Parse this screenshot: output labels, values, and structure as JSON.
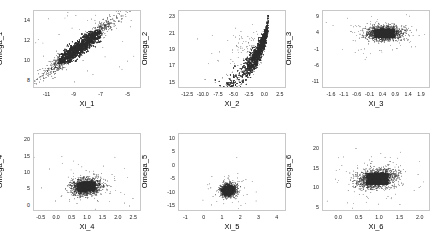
{
  "figure": {
    "background_color": "#ffffff",
    "frame_color": "#c8c8c8",
    "point_color": "#2b2b2b",
    "rows": 2,
    "cols": 3
  },
  "chart_data": [
    {
      "type": "scatter",
      "title": "",
      "xlabel": "Xi_1",
      "ylabel": "Omega_1",
      "xlim": [
        -12.0,
        -4.0
      ],
      "ylim": [
        7.2,
        15.0
      ],
      "xticks": [
        -11,
        -9,
        -7,
        -5
      ],
      "xticklabels": [
        "-11",
        "-9",
        "-7",
        "-5"
      ],
      "yticks": [
        8,
        10,
        12,
        14
      ],
      "yticklabels": [
        "8",
        "10",
        "12",
        "14"
      ],
      "grid": false,
      "legend": "none",
      "n_points": 1400,
      "relationship": "strong positive linear",
      "cluster": {
        "x_center": -8.6,
        "y_center": 11.4,
        "x_spread": 1.35,
        "y_spread": 1.45,
        "correlation": 0.96
      },
      "notes": "Dense elongated band rising from lower-left (-10.6, 9.3) to upper-right (-5.2, 14.2); sparse tail of lighter points at the upper right."
    },
    {
      "type": "scatter",
      "title": "",
      "xlabel": "Xi_2",
      "ylabel": "Omega_2",
      "xlim": [
        -14.0,
        3.5
      ],
      "ylim": [
        14.3,
        23.8
      ],
      "xticks": [
        -12.5,
        -10.0,
        -7.5,
        -5.0,
        -2.5,
        0.0,
        2.5
      ],
      "xticklabels": [
        "-12.5",
        "-10.0",
        "-7.5",
        "-5.0",
        "-2.5",
        "0.0",
        "2.5"
      ],
      "yticks": [
        15,
        17,
        19,
        21,
        23
      ],
      "yticklabels": [
        "15",
        "17",
        "19",
        "21",
        "23"
      ],
      "grid": false,
      "legend": "none",
      "n_points": 1400,
      "relationship": "nonlinear increasing, concave (exponential-like)",
      "cluster": {
        "x_center": 0.1,
        "y_center": 21.6,
        "x_spread": 0.75,
        "y_spread": 0.95,
        "correlation": 0.55
      },
      "notes": "Dense vertical cluster near x=0 spanning Omega 19.5-23.3, with a thinning curved tail sweeping down-left toward (-10, 17)."
    },
    {
      "type": "scatter",
      "title": "",
      "xlabel": "Xi_3",
      "ylabel": "Omega_3",
      "xlim": [
        -1.95,
        2.25
      ],
      "ylim": [
        -13.0,
        11.0
      ],
      "xticks": [
        -1.6,
        -1.1,
        -0.6,
        -0.1,
        0.4,
        0.9,
        1.4,
        1.9
      ],
      "xticklabels": [
        "-1.6",
        "-1.1",
        "-0.6",
        "-0.1",
        "0.4",
        "0.9",
        "1.4",
        "1.9"
      ],
      "yticks": [
        9,
        4,
        -1,
        -6,
        -11
      ],
      "yticklabels": [
        "9",
        "4",
        "-1",
        "-6",
        "-11"
      ],
      "grid": false,
      "legend": "none",
      "n_points": 1400,
      "relationship": "no correlation; horizontally elongated blob",
      "cluster": {
        "x_center": 0.45,
        "y_center": 4.1,
        "x_spread": 0.33,
        "y_spread": 1.1,
        "correlation": 0.05
      },
      "notes": "Flat dense horizontal cloud centered on Omega_3 = 4; a few scattered outliers above and well below the main band."
    },
    {
      "type": "scatter",
      "title": "",
      "xlabel": "Xi_4",
      "ylabel": "Omega_4",
      "xlim": [
        -0.75,
        2.75
      ],
      "ylim": [
        -1.8,
        22.0
      ],
      "xticks": [
        -0.5,
        0.0,
        0.5,
        1.0,
        1.5,
        2.0,
        2.5
      ],
      "xticklabels": [
        "-0.5",
        "0.0",
        "0.5",
        "1.0",
        "1.5",
        "2.0",
        "2.5"
      ],
      "yticks": [
        0,
        5,
        10,
        15,
        20
      ],
      "yticklabels": [
        "0",
        "5",
        "10",
        "15",
        "20"
      ],
      "grid": false,
      "legend": "none",
      "n_points": 1400,
      "relationship": "weak positive; compact blob with outliers",
      "cluster": {
        "x_center": 0.95,
        "y_center": 5.9,
        "x_spread": 0.24,
        "y_spread": 1.25,
        "correlation": 0.2
      },
      "notes": "Dense round cluster near (1.0, 6); two high outliers near Omega_4 = 20 and a scattered right-hand spray out to Xi_4 = 2.3."
    },
    {
      "type": "scatter",
      "title": "",
      "xlabel": "Xi_5",
      "ylabel": "Omega_5",
      "xlim": [
        -1.4,
        4.5
      ],
      "ylim": [
        -17.0,
        12.0
      ],
      "xticks": [
        -1,
        0,
        1,
        2,
        3,
        4
      ],
      "xticklabels": [
        "-1",
        "0",
        "1",
        "2",
        "3",
        "4"
      ],
      "yticks": [
        10,
        5,
        0,
        -5,
        -10,
        -15
      ],
      "yticklabels": [
        "10",
        "5",
        "0",
        "-5",
        "-10",
        "-15"
      ],
      "grid": false,
      "legend": "none",
      "n_points": 1400,
      "relationship": "no correlation; very tight blob",
      "cluster": {
        "x_center": 1.3,
        "y_center": -8.9,
        "x_spread": 0.2,
        "y_spread": 1.1,
        "correlation": 0.0
      },
      "notes": "Small tight dark cluster around (1.3, -9); isolated outliers at (1.3, 9), (0.0, -6) and (3.9, -7)."
    },
    {
      "type": "scatter",
      "title": "",
      "xlabel": "Xi_6",
      "ylabel": "Omega_6",
      "xlim": [
        -0.4,
        2.25
      ],
      "ylim": [
        4.0,
        24.0
      ],
      "xticks": [
        0.0,
        0.5,
        1.0,
        1.5,
        2.0
      ],
      "xticklabels": [
        "0.0",
        "0.5",
        "1.0",
        "1.5",
        "2.0"
      ],
      "yticks": [
        5,
        10,
        15,
        20
      ],
      "yticklabels": [
        "5",
        "10",
        "15",
        "20"
      ],
      "grid": false,
      "legend": "none",
      "n_points": 1400,
      "relationship": "weak positive; round dense blob",
      "cluster": {
        "x_center": 0.93,
        "y_center": 12.5,
        "x_spread": 0.23,
        "y_spread": 1.25,
        "correlation": 0.25
      },
      "notes": "Dense round cloud centered near (0.95, 12.3) with a wide halo; single high outlier near (1.2, 23)."
    }
  ]
}
